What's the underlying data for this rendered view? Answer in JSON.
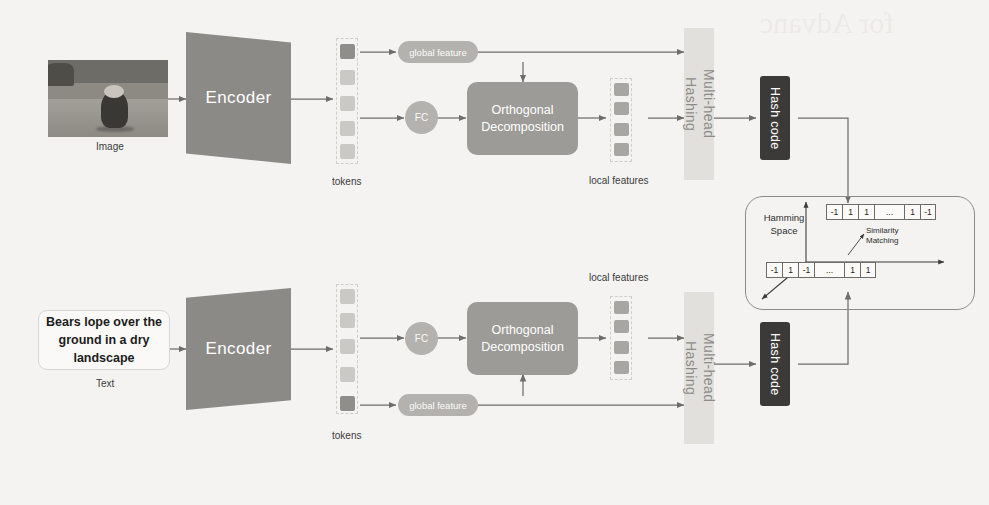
{
  "figure": {
    "watermark": "for Advanc"
  },
  "image_branch": {
    "input_label": "Image",
    "encoder_label": "Encoder",
    "tokens_label": "tokens",
    "global_feature_label": "global feature",
    "fc_label": "FC",
    "orthogonal_label": "Orthogonal\nDecomposition",
    "orthogonal_line1": "Orthogonal",
    "orthogonal_line2": "Decomposition",
    "local_features_label": "local features",
    "multihead_label": "Multi-head\nHashing",
    "multihead_line1": "Multi-head",
    "multihead_line2": "Hashing",
    "hashcode_label": "Hash code",
    "token_count": 5,
    "local_feature_count": 4,
    "highlighted_token_index": 0
  },
  "text_branch": {
    "input_text": "Bears lope over the ground in a dry landscape",
    "input_label": "Text",
    "encoder_label": "Encoder",
    "tokens_label": "tokens",
    "global_feature_label": "global feature",
    "fc_label": "FC",
    "orthogonal_line1": "Orthogonal",
    "orthogonal_line2": "Decomposition",
    "local_features_label": "local features",
    "multihead_line1": "Multi-head",
    "multihead_line2": "Hashing",
    "hashcode_label": "Hash code",
    "token_count": 5,
    "local_feature_count": 4,
    "highlighted_token_index": 4
  },
  "hamming_space": {
    "title_line1": "Hamming",
    "title_line2": "Space",
    "similarity_line1": "Similarity",
    "similarity_line2": "Matching",
    "top_code": [
      "-1",
      "1",
      "1",
      "...",
      "1",
      "-1"
    ],
    "bottom_code": [
      "-1",
      "1",
      "-1",
      "...",
      "1",
      "1"
    ]
  },
  "colors": {
    "background": "#f4f3f1",
    "encoder": "#8b8a87",
    "pill": "#b4b2ae",
    "orthogonal": "#9d9b97",
    "multihead": "#e2e0dc",
    "hashcode": "#3c3a38",
    "token": "#cbc9c5",
    "token_highlight": "#908e8a",
    "local_feature": "#a8a6a2",
    "wire": "#6f6d69",
    "outline": "#8d8b87"
  }
}
